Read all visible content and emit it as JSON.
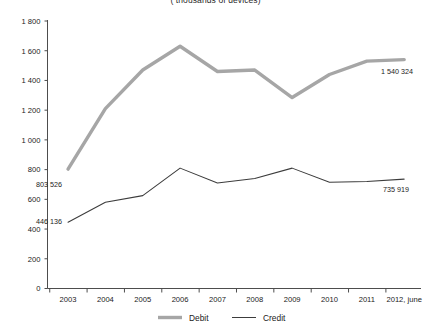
{
  "chart_data": {
    "type": "line",
    "title": "( thousands of devices)",
    "xlabel": "",
    "ylabel": "",
    "ylim": [
      0,
      1800
    ],
    "ytick_step": 200,
    "ytick_labels": [
      "0",
      "200",
      "400",
      "600",
      "800",
      "1 000",
      "1 200",
      "1 400",
      "1 600",
      "1 800"
    ],
    "ytick_values": [
      0,
      200,
      400,
      600,
      800,
      1000,
      1200,
      1400,
      1600,
      1800
    ],
    "grid": false,
    "legend_position": "bottom",
    "categories": [
      "2003",
      "2004",
      "2005",
      "2006",
      "2007",
      "2008",
      "2009",
      "2010",
      "2011",
      "2012, june"
    ],
    "series": [
      {
        "name": "Debit",
        "color": "#a6a6a6",
        "values": [
          803.526,
          1210,
          1470,
          1630,
          1460,
          1470,
          1285,
          1440,
          1530,
          1540.324
        ]
      },
      {
        "name": "Credit",
        "color": "#3c3c3c",
        "values": [
          446.136,
          580,
          625,
          810,
          710,
          740,
          810,
          715,
          720,
          735.919
        ]
      }
    ],
    "annotations": [
      {
        "name": "debit-start-value",
        "text": "803 526",
        "series": "Debit",
        "category": "2003",
        "value": 803.526
      },
      {
        "name": "debit-end-value",
        "text": "1 540 324",
        "series": "Debit",
        "category": "2012, june",
        "value": 1540.324
      },
      {
        "name": "credit-start-value",
        "text": "446 136",
        "series": "Credit",
        "category": "2003",
        "value": 446.136
      },
      {
        "name": "credit-end-value",
        "text": "735 919",
        "series": "Credit",
        "category": "2012, june",
        "value": 735.919
      }
    ]
  },
  "legend": {
    "items": [
      {
        "label": "Debit",
        "color": "#a6a6a6"
      },
      {
        "label": "Credit",
        "color": "#3c3c3c"
      }
    ]
  }
}
